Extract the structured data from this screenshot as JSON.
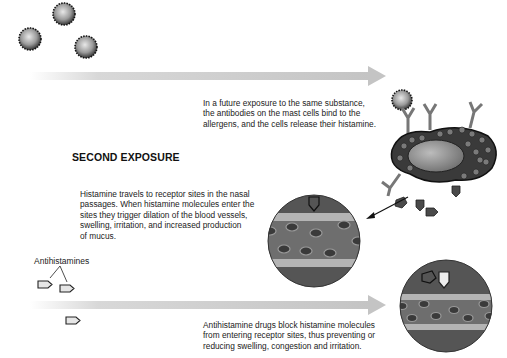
{
  "diagram": {
    "section_heading": "SECOND EXPOSURE",
    "captions": {
      "mast_cell_release": [
        "In a future exposure to the same substance,",
        "the antibodies on the mast cells bind to the",
        "allergens, and the cells release their histamine."
      ],
      "histamine_travel": [
        "Histamine travels to receptor sites in the nasal",
        "passages. When histamine molecules enter the",
        "sites they trigger dilation of the blood vessels,",
        "swelling, irritation, and increased production",
        "of mucus."
      ],
      "antihistamine_block": [
        "Antihistamine drugs block histamine molecules",
        "from entering receptor sites, thus preventing or",
        "reducing swelling, congestion and irritation."
      ]
    },
    "labels": {
      "antihistamines": "Antihistamines"
    },
    "elements": {
      "allergens": [
        "allergen-1",
        "allergen-2",
        "allergen-3",
        "allergen-bound"
      ],
      "mast_cell": "mast-cell-with-antibodies",
      "histamine_molecules": 5,
      "receptor_views": [
        "blood-vessel-histamine",
        "blood-vessel-antihistamine"
      ],
      "arrows": [
        "time-arrow-top",
        "time-arrow-bottom",
        "histamine-pointer"
      ]
    },
    "colors": {
      "arrow_gradient": "#c8c8c8",
      "tissue_dark": "#555555",
      "vessel_band": "#b0b0b0",
      "vessel_mid": "#6e6e6e",
      "cell_fill": "#7a7a7a",
      "nucleus": "#2a2a2a",
      "histamine": "#4a4a4a",
      "antihistamine": "#e6e6e6"
    }
  }
}
